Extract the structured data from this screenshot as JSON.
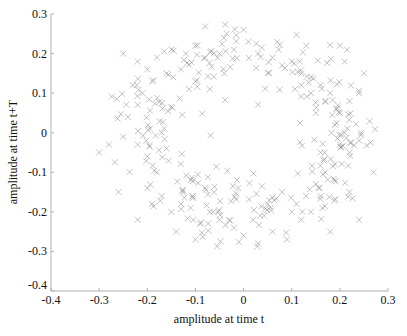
{
  "chart_data": {
    "type": "scatter",
    "title": "",
    "xlabel": "amplitude at time t",
    "ylabel": "amplitude at time t+T",
    "xlim": [
      -0.4,
      0.3
    ],
    "ylim": [
      -0.4,
      0.3
    ],
    "xticks": [
      -0.4,
      -0.3,
      -0.2,
      -0.1,
      0,
      0.1,
      0.2,
      0.3
    ],
    "yticks": [
      -0.4,
      -0.3,
      -0.2,
      -0.1,
      0,
      0.1,
      0.2,
      0.3
    ],
    "xtick_labels": [
      "-0.4",
      "-0.3",
      "-0.2",
      "-0.1",
      "0",
      "0.1",
      "0.2",
      "0.3"
    ],
    "ytick_labels": [
      "-0.4",
      "-0.3",
      "-0.2",
      "-0.1",
      "0",
      "0.1",
      "0.2",
      "0.3"
    ],
    "grid": false,
    "legend": null,
    "marker": "x",
    "marker_color": "#8a8a8a",
    "axis_color": "#b0b0b0",
    "ring": {
      "center": [
        0.0,
        0.0
      ],
      "radius_x": 0.205,
      "radius_y": 0.2,
      "noise": 0.035,
      "count": 620
    },
    "sample_points": [
      [
        -0.25,
        0.2
      ],
      [
        -0.22,
        0.18
      ],
      [
        -0.2,
        0.16
      ],
      [
        -0.18,
        0.19
      ],
      [
        -0.15,
        0.21
      ],
      [
        -0.12,
        0.2
      ],
      [
        -0.1,
        0.22
      ],
      [
        -0.08,
        0.19
      ],
      [
        -0.05,
        0.2
      ],
      [
        -0.02,
        0.21
      ],
      [
        0.0,
        0.26
      ],
      [
        0.01,
        0.23
      ],
      [
        0.03,
        0.2
      ],
      [
        0.06,
        0.19
      ],
      [
        0.08,
        0.17
      ],
      [
        0.1,
        0.18
      ],
      [
        0.12,
        0.15
      ],
      [
        0.14,
        0.14
      ],
      [
        0.16,
        0.12
      ],
      [
        0.18,
        0.1
      ],
      [
        0.2,
        0.22
      ],
      [
        0.21,
        0.18
      ],
      [
        0.22,
        0.08
      ],
      [
        0.2,
        0.05
      ],
      [
        0.19,
        0.02
      ],
      [
        0.21,
        0.0
      ],
      [
        0.2,
        -0.03
      ],
      [
        0.22,
        -0.05
      ],
      [
        0.24,
        -0.02
      ],
      [
        0.27,
        -0.1
      ],
      [
        0.19,
        -0.08
      ],
      [
        0.17,
        -0.1
      ],
      [
        0.15,
        -0.13
      ],
      [
        0.13,
        -0.16
      ],
      [
        0.11,
        -0.18
      ],
      [
        0.1,
        -0.2
      ],
      [
        0.12,
        -0.22
      ],
      [
        0.14,
        -0.2
      ],
      [
        0.16,
        -0.16
      ],
      [
        0.18,
        -0.25
      ],
      [
        0.08,
        -0.15
      ],
      [
        0.05,
        -0.18
      ],
      [
        0.02,
        -0.22
      ],
      [
        0.0,
        -0.26
      ],
      [
        -0.02,
        -0.24
      ],
      [
        -0.05,
        -0.22
      ],
      [
        -0.07,
        -0.2
      ],
      [
        -0.09,
        -0.23
      ],
      [
        -0.11,
        -0.19
      ],
      [
        -0.13,
        -0.18
      ],
      [
        -0.15,
        -0.2
      ],
      [
        -0.17,
        -0.16
      ],
      [
        -0.19,
        -0.18
      ],
      [
        -0.2,
        -0.14
      ],
      [
        -0.22,
        -0.22
      ],
      [
        -0.18,
        -0.1
      ],
      [
        -0.2,
        -0.06
      ],
      [
        -0.22,
        -0.03
      ],
      [
        -0.25,
        -0.01
      ],
      [
        -0.28,
        -0.03
      ],
      [
        -0.3,
        -0.05
      ],
      [
        -0.24,
        0.04
      ],
      [
        -0.22,
        0.07
      ],
      [
        -0.21,
        0.1
      ],
      [
        -0.23,
        0.12
      ],
      [
        -0.19,
        0.13
      ],
      [
        -0.16,
        0.15
      ],
      [
        -0.13,
        0.16
      ],
      [
        -0.1,
        0.13
      ],
      [
        -0.07,
        0.11
      ],
      [
        0.15,
        0.05
      ],
      [
        0.17,
        0.08
      ],
      [
        0.14,
        0.1
      ],
      [
        0.12,
        0.12
      ],
      [
        0.24,
        0.1
      ],
      [
        0.25,
        0.15
      ],
      [
        0.13,
        0.22
      ],
      [
        0.22,
        -0.15
      ],
      [
        0.24,
        -0.22
      ],
      [
        -0.04,
        0.15
      ],
      [
        -0.26,
        -0.15
      ],
      [
        -0.14,
        -0.25
      ],
      [
        -0.1,
        -0.27
      ],
      [
        0.06,
        -0.25
      ],
      [
        0.09,
        -0.27
      ],
      [
        0.03,
        -0.28
      ],
      [
        -0.17,
        0.0
      ],
      [
        -0.16,
        -0.04
      ],
      [
        0.16,
        -0.05
      ],
      [
        -0.08,
        -0.14
      ]
    ]
  }
}
